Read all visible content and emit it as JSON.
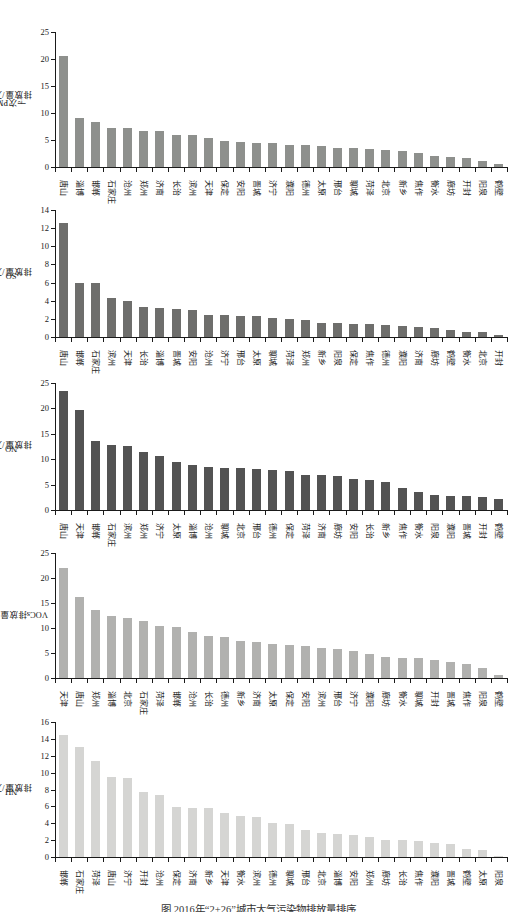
{
  "figure": {
    "caption": "图 2016年“2+26”城市大气污染物排放量排序",
    "background": "#ffffff",
    "axis_color": "#1a1a1a"
  },
  "chart_data": [
    {
      "type": "bar",
      "ylabel": "一次PM2.5排放量/万t",
      "ylabel_parts": [
        {
          "text": "一次PM"
        },
        {
          "text": "2.5",
          "sub": true
        },
        {
          "text": "排放量/万t"
        }
      ],
      "ylim": [
        0,
        25
      ],
      "ytick_step": 5,
      "grid": false,
      "legend": "none",
      "bar_color": "#8e908d",
      "categories": [
        "唐山",
        "淄博",
        "邯郸",
        "石家庄",
        "沧州",
        "郑州",
        "济南",
        "长治",
        "滨州",
        "天津",
        "保定",
        "安阳",
        "晋城",
        "济宁",
        "濮阳",
        "德州",
        "太原",
        "邢台",
        "聊城",
        "菏泽",
        "北京",
        "新乡",
        "焦作",
        "衡水",
        "廊坊",
        "开封",
        "阳泉",
        "鹤壁"
      ],
      "values": [
        20.5,
        9.0,
        8.3,
        7.2,
        7.2,
        6.7,
        6.6,
        6.0,
        6.0,
        5.4,
        4.9,
        4.6,
        4.5,
        4.4,
        4.1,
        4.0,
        3.8,
        3.6,
        3.5,
        3.3,
        3.2,
        2.9,
        2.6,
        2.1,
        1.9,
        1.6,
        1.2,
        0.6
      ]
    },
    {
      "type": "bar",
      "ylabel": "SO2排放量/万t",
      "ylabel_parts": [
        {
          "text": "SO"
        },
        {
          "text": "2",
          "sub": true
        },
        {
          "text": "排放量/万t"
        }
      ],
      "ylim": [
        0,
        14
      ],
      "ytick_step": 2,
      "grid": false,
      "legend": "none",
      "bar_color": "#6e6e6c",
      "categories": [
        "唐山",
        "邯郸",
        "石家庄",
        "滨州",
        "天津",
        "长治",
        "淄博",
        "晋城",
        "安阳",
        "沧州",
        "济宁",
        "邢台",
        "太原",
        "聊城",
        "菏泽",
        "郑州",
        "新乡",
        "阳泉",
        "保定",
        "焦作",
        "德州",
        "濮阳",
        "济南",
        "廊坊",
        "鹤壁",
        "衡水",
        "北京",
        "开封"
      ],
      "values": [
        12.6,
        6.0,
        5.9,
        4.3,
        4.0,
        3.3,
        3.2,
        3.1,
        3.0,
        2.4,
        2.4,
        2.3,
        2.3,
        2.1,
        2.0,
        1.9,
        1.5,
        1.5,
        1.4,
        1.4,
        1.3,
        1.2,
        1.1,
        1.0,
        0.8,
        0.6,
        0.5,
        0.2
      ]
    },
    {
      "type": "bar",
      "ylabel": "NOx排放量/万t",
      "ylabel_parts": [
        {
          "text": "NO"
        },
        {
          "text": "x",
          "sub": true
        },
        {
          "text": "排放量/万t"
        }
      ],
      "ylim": [
        0,
        25
      ],
      "ytick_step": 5,
      "grid": false,
      "legend": "none",
      "bar_color": "#535353",
      "categories": [
        "唐山",
        "天津",
        "邯郸",
        "石家庄",
        "滨州",
        "郑州",
        "济宁",
        "太原",
        "淄博",
        "沧州",
        "聊城",
        "北京",
        "邢台",
        "德州",
        "保定",
        "菏泽",
        "济南",
        "廊坊",
        "安阳",
        "长治",
        "新乡",
        "焦作",
        "衡水",
        "阳泉",
        "濮阳",
        "晋城",
        "开封",
        "鹤壁"
      ],
      "values": [
        23.4,
        19.6,
        13.5,
        12.8,
        12.6,
        11.4,
        10.7,
        9.5,
        8.8,
        8.5,
        8.3,
        8.2,
        8.0,
        7.9,
        7.6,
        6.9,
        6.8,
        6.7,
        6.2,
        6.0,
        5.6,
        4.4,
        3.6,
        3.0,
        2.8,
        2.7,
        2.6,
        2.2
      ]
    },
    {
      "type": "bar",
      "ylabel": "VOCs排放量/万t",
      "ylabel_parts": [
        {
          "text": "VOCs排放量/万t"
        }
      ],
      "ylim": [
        0,
        25
      ],
      "ytick_step": 5,
      "grid": false,
      "legend": "none",
      "bar_color": "#b1b1af",
      "categories": [
        "天津",
        "唐山",
        "郑州",
        "淄博",
        "北京",
        "石家庄",
        "菏泽",
        "邯郸",
        "沧州",
        "长治",
        "德州",
        "新乡",
        "济南",
        "太原",
        "保定",
        "安阳",
        "滨州",
        "邢台",
        "济宁",
        "濮阳",
        "廊坊",
        "衡水",
        "聊城",
        "开封",
        "晋城",
        "焦作",
        "阳泉",
        "鹤壁"
      ],
      "values": [
        22.1,
        16.2,
        13.7,
        12.4,
        12.1,
        11.5,
        10.4,
        10.3,
        9.3,
        8.4,
        8.3,
        7.4,
        7.2,
        6.9,
        6.7,
        6.5,
        6.0,
        5.8,
        5.5,
        4.9,
        4.2,
        4.1,
        4.0,
        3.7,
        3.3,
        2.9,
        2.0,
        0.7
      ]
    },
    {
      "type": "bar",
      "ylabel": "NH3排放量/万t",
      "ylabel_parts": [
        {
          "text": "NH"
        },
        {
          "text": "3",
          "sub": true
        },
        {
          "text": "排放量/万t"
        }
      ],
      "ylim": [
        0,
        16
      ],
      "ytick_step": 2,
      "grid": false,
      "legend": "none",
      "bar_color": "#d5d5d3",
      "categories": [
        "邯郸",
        "石家庄",
        "菏泽",
        "唐山",
        "济宁",
        "开封",
        "沧州",
        "保定",
        "济南",
        "新乡",
        "天津",
        "衡水",
        "滨州",
        "德州",
        "聊城",
        "邢台",
        "北京",
        "淄博",
        "安阳",
        "郑州",
        "廊坊",
        "长治",
        "焦作",
        "濮阳",
        "晋城",
        "鹤壁",
        "太原",
        "阳泉"
      ],
      "values": [
        14.5,
        13.0,
        11.4,
        9.5,
        9.4,
        7.7,
        7.4,
        5.9,
        5.8,
        5.8,
        5.2,
        4.9,
        4.8,
        4.0,
        3.9,
        3.2,
        2.9,
        2.7,
        2.6,
        2.4,
        2.0,
        2.0,
        1.9,
        1.7,
        1.5,
        0.9,
        0.8,
        0.1
      ]
    }
  ]
}
